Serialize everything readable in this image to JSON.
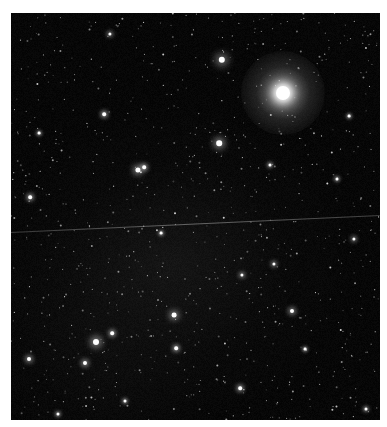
{
  "image": {
    "subject": "Starfield astrophotograph",
    "frame": {
      "x": 11,
      "y": 13,
      "width": 369,
      "height": 407,
      "border_color": "#ffffff",
      "sky_color": "#050505"
    },
    "bright_star": {
      "x": 272,
      "y": 80,
      "core_radius": 7,
      "halo_radius": 42,
      "color": "#ffffff"
    },
    "satellite_trail": {
      "x1": 0,
      "y1": 219,
      "x2": 369,
      "y2": 202,
      "color": "#9a9a9a"
    },
    "notable_stars": [
      {
        "x": 211,
        "y": 47,
        "r": 3.2
      },
      {
        "x": 208,
        "y": 130,
        "r": 2.8
      },
      {
        "x": 127,
        "y": 157,
        "r": 2.6
      },
      {
        "x": 133,
        "y": 154,
        "r": 1.8
      },
      {
        "x": 85,
        "y": 329,
        "r": 3.0
      },
      {
        "x": 163,
        "y": 302,
        "r": 2.4
      },
      {
        "x": 74,
        "y": 350,
        "r": 2.0
      },
      {
        "x": 101,
        "y": 320,
        "r": 1.8
      },
      {
        "x": 165,
        "y": 335,
        "r": 1.8
      },
      {
        "x": 281,
        "y": 298,
        "r": 2.0
      },
      {
        "x": 19,
        "y": 184,
        "r": 1.8
      },
      {
        "x": 18,
        "y": 346,
        "r": 2.0
      },
      {
        "x": 263,
        "y": 251,
        "r": 1.6
      },
      {
        "x": 231,
        "y": 262,
        "r": 1.6
      },
      {
        "x": 99,
        "y": 21,
        "r": 1.6
      },
      {
        "x": 93,
        "y": 101,
        "r": 1.8
      },
      {
        "x": 343,
        "y": 226,
        "r": 1.6
      },
      {
        "x": 355,
        "y": 396,
        "r": 1.5
      },
      {
        "x": 229,
        "y": 375,
        "r": 1.8
      },
      {
        "x": 28,
        "y": 120,
        "r": 1.4
      },
      {
        "x": 326,
        "y": 166,
        "r": 1.5
      },
      {
        "x": 338,
        "y": 103,
        "r": 1.4
      },
      {
        "x": 259,
        "y": 152,
        "r": 1.5
      },
      {
        "x": 150,
        "y": 220,
        "r": 1.4
      },
      {
        "x": 114,
        "y": 388,
        "r": 1.5
      },
      {
        "x": 294,
        "y": 336,
        "r": 1.4
      },
      {
        "x": 47,
        "y": 401,
        "r": 1.5
      }
    ],
    "faint_star_count": 900,
    "faint_star_seed": 42
  }
}
